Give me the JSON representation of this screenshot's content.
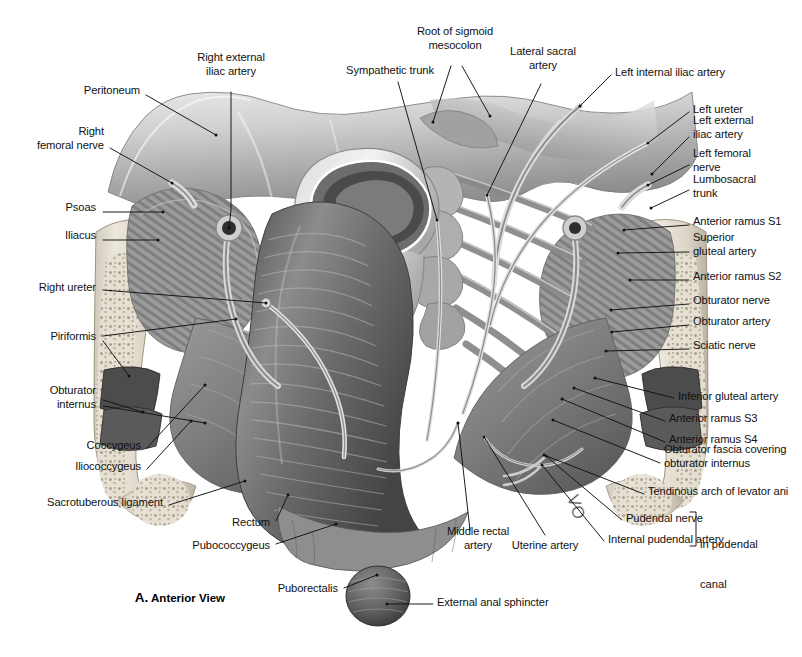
{
  "figure": {
    "caption_letter": "A.",
    "caption_text": "Anterior View",
    "bracket_note_line1": "in pudendal",
    "bracket_note_line2": "canal",
    "width": 802,
    "height": 657,
    "background": "#ffffff",
    "ink": "#111111"
  },
  "labels": [
    {
      "id": "peritoneum",
      "text": "Peritoneum",
      "x": 140,
      "y": 91,
      "align": "right",
      "lines": [
        "Peritoneum"
      ]
    },
    {
      "id": "right-external-iliac-artery",
      "text": "Right external iliac artery",
      "x": 231,
      "y": 65,
      "align": "center",
      "lines": [
        "Right external",
        "iliac artery"
      ]
    },
    {
      "id": "sympathetic-trunk",
      "text": "Sympathetic trunk",
      "x": 390,
      "y": 71,
      "align": "center",
      "lines": [
        "Sympathetic trunk"
      ]
    },
    {
      "id": "root-of-sigmoid-mesocolon",
      "text": "Root of sigmoid mesocolon",
      "x": 455,
      "y": 39,
      "align": "center",
      "lines": [
        "Root of sigmoid",
        "mesocolon"
      ]
    },
    {
      "id": "lateral-sacral-artery",
      "text": "Lateral sacral artery",
      "x": 543,
      "y": 59,
      "align": "center",
      "lines": [
        "Lateral sacral",
        "artery"
      ]
    },
    {
      "id": "left-internal-iliac-artery",
      "text": "Left internal iliac artery",
      "x": 615,
      "y": 73,
      "align": "left",
      "lines": [
        "Left internal iliac artery"
      ]
    },
    {
      "id": "right-femoral-nerve",
      "text": "Right femoral nerve",
      "x": 104,
      "y": 139,
      "align": "right",
      "lines": [
        "Right",
        "femoral nerve"
      ]
    },
    {
      "id": "left-ureter",
      "text": "Left ureter",
      "x": 693,
      "y": 110,
      "align": "left",
      "lines": [
        "Left ureter"
      ]
    },
    {
      "id": "left-external-iliac-artery",
      "text": "Left external iliac artery",
      "x": 693,
      "y": 128,
      "align": "left",
      "lines": [
        "Left external",
        "iliac artery"
      ]
    },
    {
      "id": "left-femoral-nerve",
      "text": "Left femoral nerve",
      "x": 693,
      "y": 161,
      "align": "left",
      "lines": [
        "Left femoral",
        "nerve"
      ]
    },
    {
      "id": "lumbosacral-trunk",
      "text": "Lumbosacral trunk",
      "x": 693,
      "y": 187,
      "align": "left",
      "lines": [
        "Lumbosacral",
        "trunk"
      ]
    },
    {
      "id": "psoas",
      "text": "Psoas",
      "x": 96,
      "y": 208,
      "align": "right",
      "lines": [
        "Psoas"
      ]
    },
    {
      "id": "anterior-ramus-s1",
      "text": "Anterior ramus S1",
      "x": 693,
      "y": 222,
      "align": "left",
      "lines": [
        "Anterior ramus S1"
      ]
    },
    {
      "id": "iliacus",
      "text": "Iliacus",
      "x": 96,
      "y": 236,
      "align": "right",
      "lines": [
        "Iliacus"
      ]
    },
    {
      "id": "superior-gluteal-artery",
      "text": "Superior gluteal artery",
      "x": 693,
      "y": 245,
      "align": "left",
      "lines": [
        "Superior",
        "gluteal artery"
      ]
    },
    {
      "id": "anterior-ramus-s2",
      "text": "Anterior ramus S2",
      "x": 693,
      "y": 277,
      "align": "left",
      "lines": [
        "Anterior ramus S2"
      ]
    },
    {
      "id": "right-ureter",
      "text": "Right ureter",
      "x": 96,
      "y": 288,
      "align": "right",
      "lines": [
        "Right ureter"
      ]
    },
    {
      "id": "obturator-nerve",
      "text": "Obturator nerve",
      "x": 693,
      "y": 301,
      "align": "left",
      "lines": [
        "Obturator nerve"
      ]
    },
    {
      "id": "obturator-artery",
      "text": "Obturator artery",
      "x": 693,
      "y": 322,
      "align": "left",
      "lines": [
        "Obturator artery"
      ]
    },
    {
      "id": "piriformis",
      "text": "Piriformis",
      "x": 96,
      "y": 337,
      "align": "right",
      "lines": [
        "Piriformis"
      ]
    },
    {
      "id": "sciatic-nerve",
      "text": "Sciatic nerve",
      "x": 693,
      "y": 346,
      "align": "left",
      "lines": [
        "Sciatic nerve"
      ]
    },
    {
      "id": "obturator-internus",
      "text": "Obturator internus",
      "x": 96,
      "y": 398,
      "align": "right",
      "lines": [
        "Obturator",
        "internus"
      ]
    },
    {
      "id": "inferior-gluteal-artery",
      "text": "Inferior gluteal artery",
      "x": 678,
      "y": 397,
      "align": "left",
      "lines": [
        "Inferior gluteal artery"
      ]
    },
    {
      "id": "anterior-ramus-s3",
      "text": "Anterior ramus S3",
      "x": 669,
      "y": 419,
      "align": "left",
      "lines": [
        "Anterior ramus S3"
      ]
    },
    {
      "id": "coccygeus",
      "text": "Coccygeus",
      "x": 141,
      "y": 446,
      "align": "right",
      "lines": [
        "Coccygeus"
      ]
    },
    {
      "id": "anterior-ramus-s4",
      "text": "Anterior ramus S4",
      "x": 669,
      "y": 440,
      "align": "left",
      "lines": [
        "Anterior ramus S4"
      ]
    },
    {
      "id": "iliococcygeus",
      "text": "Iliococcygeus",
      "x": 141,
      "y": 467,
      "align": "right",
      "lines": [
        "Iliococcygeus"
      ]
    },
    {
      "id": "obturator-fascia",
      "text": "Obturator fascia covering obturator internus",
      "x": 664,
      "y": 457,
      "align": "left",
      "lines": [
        "Obturator fascia covering",
        "obturator internus"
      ]
    },
    {
      "id": "tendinous-arch-of-levator-ani",
      "text": "Tendinous arch of levator ani",
      "x": 648,
      "y": 492,
      "align": "left",
      "lines": [
        "Tendinous arch of levator ani"
      ]
    },
    {
      "id": "sacrotuberous-ligament",
      "text": "Sacrotuberous ligament",
      "x": 163,
      "y": 503,
      "align": "right",
      "lines": [
        "Sacrotuberous ligament"
      ]
    },
    {
      "id": "rectum",
      "text": "Rectum",
      "x": 270,
      "y": 523,
      "align": "right",
      "lines": [
        "Rectum"
      ]
    },
    {
      "id": "pudendal-nerve",
      "text": "Pudendal nerve",
      "x": 626,
      "y": 519,
      "align": "left",
      "lines": [
        "Pudendal nerve"
      ]
    },
    {
      "id": "pubococcygeus",
      "text": "Pubococcygeus",
      "x": 270,
      "y": 546,
      "align": "right",
      "lines": [
        "Pubococcygeus"
      ]
    },
    {
      "id": "internal-pudendal-artery",
      "text": "Internal pudendal artery",
      "x": 608,
      "y": 540,
      "align": "left",
      "lines": [
        "Internal pudendal artery"
      ]
    },
    {
      "id": "middle-rectal-artery",
      "text": "Middle rectal artery",
      "x": 478,
      "y": 539,
      "align": "center",
      "lines": [
        "Middle rectal",
        "artery"
      ]
    },
    {
      "id": "uterine-artery",
      "text": "Uterine artery",
      "x": 545,
      "y": 546,
      "align": "center",
      "lines": [
        "Uterine artery"
      ]
    },
    {
      "id": "puborectalis",
      "text": "Puborectalis",
      "x": 338,
      "y": 589,
      "align": "right",
      "lines": [
        "Puborectalis"
      ]
    },
    {
      "id": "external-anal-sphincter",
      "text": "External anal sphincter",
      "x": 437,
      "y": 603,
      "align": "left",
      "lines": [
        "External anal sphincter"
      ]
    }
  ],
  "leaders": [
    {
      "id": "leader-peritoneum",
      "path": "M 146 95 L 216 135"
    },
    {
      "id": "leader-right-external-iliac-artery",
      "path": "M 231 92 L 231 210 L 229 228"
    },
    {
      "id": "leader-sympathetic-trunk",
      "path": "M 398 82 L 437 220"
    },
    {
      "id": "leader-root-of-sigmoid-mesocolon-a",
      "path": "M 451 66 L 433 122"
    },
    {
      "id": "leader-root-of-sigmoid-mesocolon-b",
      "path": "M 462 66 L 490 116"
    },
    {
      "id": "leader-lateral-sacral-artery",
      "path": "M 541 84 L 487 195"
    },
    {
      "id": "leader-left-internal-iliac-artery",
      "path": "M 611 75 L 580 106"
    },
    {
      "id": "leader-right-femoral-nerve",
      "path": "M 110 148 L 172 183"
    },
    {
      "id": "leader-left-ureter",
      "path": "M 689 112 L 648 143"
    },
    {
      "id": "leader-left-external-iliac-artery",
      "path": "M 689 137 L 652 174"
    },
    {
      "id": "leader-left-femoral-nerve",
      "path": "M 689 165 L 648 185"
    },
    {
      "id": "leader-lumbosacral-trunk",
      "path": "M 689 190 L 651 208"
    },
    {
      "id": "leader-psoas",
      "path": "M 103 212 L 163 212"
    },
    {
      "id": "leader-anterior-ramus-s1",
      "path": "M 689 225 L 624 230"
    },
    {
      "id": "leader-iliacus",
      "path": "M 103 240 L 158 240"
    },
    {
      "id": "leader-superior-gluteal-artery",
      "path": "M 689 252 L 618 253"
    },
    {
      "id": "leader-anterior-ramus-s2",
      "path": "M 689 280 L 630 280"
    },
    {
      "id": "leader-right-ureter",
      "path": "M 103 290 L 266 303"
    },
    {
      "id": "leader-obturator-nerve",
      "path": "M 689 304 L 611 310"
    },
    {
      "id": "leader-obturator-artery",
      "path": "M 689 325 L 612 332"
    },
    {
      "id": "leader-piriformis-a",
      "path": "M 103 336 L 236 319"
    },
    {
      "id": "leader-piriformis-b",
      "path": "M 103 341 L 129 376"
    },
    {
      "id": "leader-sciatic-nerve",
      "path": "M 689 349 L 606 351"
    },
    {
      "id": "leader-obturator-internus-a",
      "path": "M 103 400 L 143 412"
    },
    {
      "id": "leader-obturator-internus-b",
      "path": "M 103 406 L 205 423"
    },
    {
      "id": "leader-inferior-gluteal-artery",
      "path": "M 674 398 L 595 378"
    },
    {
      "id": "leader-anterior-ramus-s3",
      "path": "M 665 421 L 574 388"
    },
    {
      "id": "leader-coccygeus",
      "path": "M 147 448 L 205 385"
    },
    {
      "id": "leader-anterior-ramus-s4",
      "path": "M 665 442 L 562 399"
    },
    {
      "id": "leader-iliococcygeus",
      "path": "M 147 469 L 191 421"
    },
    {
      "id": "leader-obturator-fascia",
      "path": "M 660 463 L 553 420"
    },
    {
      "id": "leader-tendinous-arch",
      "path": "M 644 494 L 544 455"
    },
    {
      "id": "leader-sacrotuberous-ligament",
      "path": "M 169 505 L 245 481"
    },
    {
      "id": "leader-rectum",
      "path": "M 276 521 L 288 495"
    },
    {
      "id": "leader-pudendal-nerve",
      "path": "M 622 520 L 546 456"
    },
    {
      "id": "leader-pubococcygeus",
      "path": "M 276 544 L 336 524"
    },
    {
      "id": "leader-internal-pudendal-artery",
      "path": "M 604 541 L 542 465"
    },
    {
      "id": "leader-middle-rectal-artery",
      "path": "M 470 530 L 458 423"
    },
    {
      "id": "leader-uterine-artery",
      "path": "M 545 535 L 484 437"
    },
    {
      "id": "leader-puborectalis",
      "path": "M 344 588 L 377 575"
    },
    {
      "id": "leader-external-anal-sphincter",
      "path": "M 433 604 L 387 604"
    },
    {
      "id": "leader-bracket",
      "path": "M 690 512 L 696 512 L 696 546 L 690 546"
    }
  ]
}
